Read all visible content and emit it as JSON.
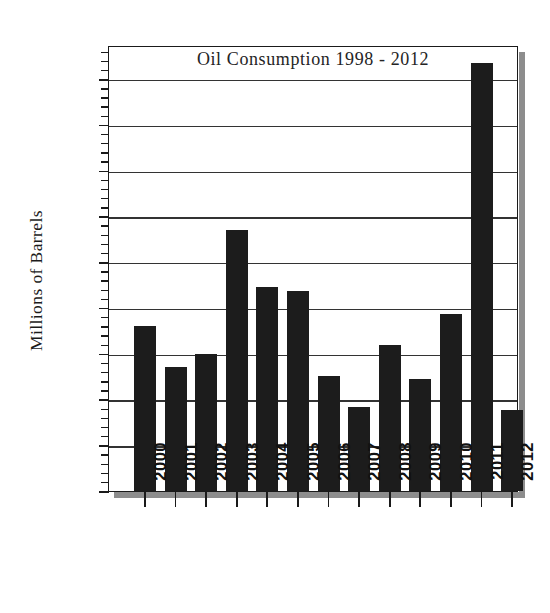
{
  "chart_data": {
    "type": "bar",
    "title": "Oil Consumption 1998 - 2012",
    "xlabel": "",
    "ylabel": "Millions of Barrels",
    "categories": [
      "2000",
      "2001",
      "2002",
      "2003",
      "2004",
      "2005",
      "2006",
      "2007",
      "2008",
      "2009",
      "2010",
      "2011",
      "2012"
    ],
    "values": [
      18.0,
      13.6,
      15.0,
      28.5,
      22.3,
      21.9,
      12.6,
      9.2,
      15.9,
      12.2,
      19.3,
      46.7,
      8.8
    ],
    "ylim": [
      0,
      48.5
    ],
    "ytick_values": [
      0,
      5,
      10,
      15,
      20,
      25,
      30,
      35,
      40,
      45
    ],
    "ytick_labels": [
      "00",
      "05",
      "10",
      "15",
      "20",
      "25",
      "30",
      "35",
      "40",
      "45"
    ],
    "minor_tick_step": 1,
    "grid": true,
    "grid_axis": "y",
    "legend": null,
    "bar_color": "#1c1c1c",
    "series": [
      {
        "name": "Oil Consumption",
        "values": [
          18.0,
          13.6,
          15.0,
          28.5,
          22.3,
          21.9,
          12.6,
          9.2,
          15.9,
          12.2,
          19.3,
          46.7,
          8.8
        ]
      }
    ]
  },
  "style": {
    "background": "#ffffff",
    "axis_color": "#1a1a1a",
    "grid_color": "#333333",
    "shadow_color": "#8d8d8d",
    "text_color": "#121212"
  }
}
